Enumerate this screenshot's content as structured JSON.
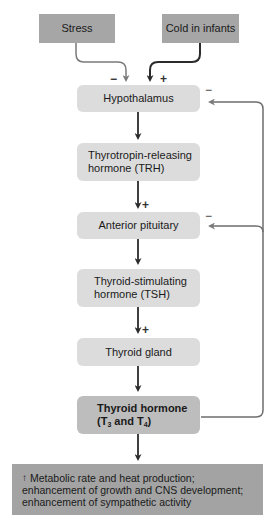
{
  "diagram": {
    "inputs": [
      {
        "id": "stress",
        "label": "Stress",
        "effect": "−"
      },
      {
        "id": "cold",
        "label": "Cold in infants",
        "effect": "+"
      }
    ],
    "nodes": [
      {
        "id": "hypothalamus",
        "label": "Hypothalamus",
        "feedback_sign": "−"
      },
      {
        "id": "trh",
        "label_line1": "Thyrotropin-releasing",
        "label_line2": "hormone (TRH)"
      },
      {
        "id": "anterior_pituitary",
        "label": "Anterior pituitary",
        "feedback_sign": "−"
      },
      {
        "id": "tsh",
        "label_line1": "Thyroid-stimulating",
        "label_line2": "hormone (TSH)"
      },
      {
        "id": "thyroid_gland",
        "label": "Thyroid gland"
      },
      {
        "id": "thyroid_hormone",
        "label_line1": "Thyroid hormone",
        "label_line2_prefix": "(T",
        "sub1": "3",
        "label_line2_mid": " and T",
        "sub2": "4",
        "label_line2_suffix": ")"
      }
    ],
    "edge_signs": {
      "trh_to_pituitary": "+",
      "tsh_to_thyroid": "+"
    },
    "effects": {
      "arrow": "↑",
      "line1": "Metabolic rate and heat production;",
      "line2": "enhancement of growth and CNS development;",
      "line3": "enhancement of sympathetic activity"
    },
    "colors": {
      "source_box": "#a6a6a6",
      "step_box": "#dcdcdc",
      "hormone_box": "#bdbdbd",
      "effects_box": "#a3a3a3",
      "arrow_dark": "#333333",
      "arrow_feedback": "#6e6e6e"
    }
  }
}
